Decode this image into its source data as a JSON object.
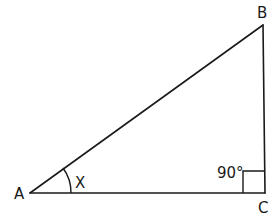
{
  "diagram": {
    "type": "right-triangle",
    "vertices": {
      "A": {
        "label": "A"
      },
      "B": {
        "label": "B"
      },
      "C": {
        "label": "C"
      }
    },
    "angle_at_A": {
      "label": "X"
    },
    "angle_at_C": {
      "label": "90°"
    },
    "colors": {
      "stroke": "#1a1a1a",
      "background": "#ffffff"
    }
  }
}
